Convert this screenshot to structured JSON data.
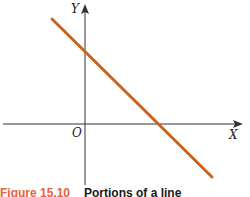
{
  "figure": {
    "y_axis_label": "Y",
    "x_axis_label": "X",
    "origin_label": "O",
    "line_color": "#c8641e",
    "axis_color": "#333333",
    "caption_number": "Figure 15.10",
    "caption_title": "Portions of a line",
    "caption_number_color": "#e8613a"
  }
}
